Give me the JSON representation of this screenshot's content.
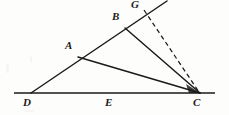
{
  "figure": {
    "background_color": "#fdfdfc",
    "stroke_color": "#1a1a1a",
    "width": 229,
    "height": 115,
    "labels": {
      "A": "A",
      "B": "B",
      "C": "C",
      "D": "D",
      "E": "E",
      "G": "G"
    },
    "points": [
      {
        "name": "A",
        "x": 78,
        "y": 57,
        "label_x": 65,
        "label_y": 40,
        "on_line": "D-G ray"
      },
      {
        "name": "B",
        "x": 125,
        "y": 28,
        "label_x": 112,
        "label_y": 11,
        "on_line": "D-G ray"
      },
      {
        "name": "C",
        "x": 200,
        "y": 93,
        "label_x": 193,
        "label_y": 97,
        "on_line": "baseline"
      },
      {
        "name": "D",
        "x": 31,
        "y": 93,
        "label_x": 24,
        "label_y": 97,
        "on_line": "baseline"
      },
      {
        "name": "E",
        "x": 110,
        "y": 93,
        "label_x": 105,
        "label_y": 97,
        "on_line": "baseline"
      },
      {
        "name": "G",
        "x": 143,
        "y": 9,
        "label_x": 131,
        "label_y": 0,
        "on_line": "D-G ray"
      }
    ],
    "segments": [
      {
        "name": "baseline-DEC",
        "from": [
          14,
          93
        ],
        "to": [
          215,
          93
        ],
        "style": "solid",
        "width": 1.6
      },
      {
        "name": "ray-D-through-G",
        "from": [
          31,
          93
        ],
        "to": [
          167,
          1
        ],
        "style": "solid",
        "width": 1.5
      },
      {
        "name": "segment-A-C",
        "from": [
          78,
          57
        ],
        "to": [
          200,
          93
        ],
        "style": "solid",
        "width": 1.5
      },
      {
        "name": "segment-B-C",
        "from": [
          125,
          28
        ],
        "to": [
          200,
          93
        ],
        "style": "solid",
        "width": 1.5
      },
      {
        "name": "segment-G-C",
        "from": [
          144,
          10
        ],
        "to": [
          200,
          93
        ],
        "style": "dashed",
        "width": 1.3
      }
    ]
  }
}
